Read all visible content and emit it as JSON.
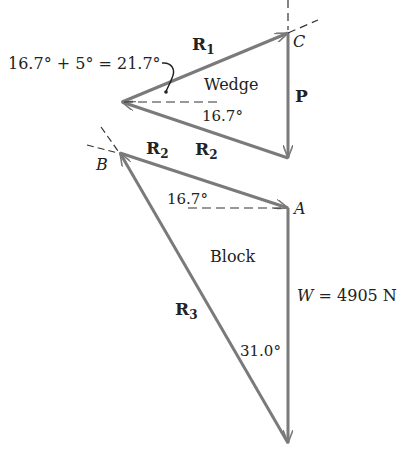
{
  "colors": {
    "vector": "#7a7a7a",
    "text": "#222222",
    "dash": "#333333"
  },
  "wedge": {
    "label": "Wedge",
    "angle_bottom": "16.7°",
    "angle_annotation": "16.7° + 5° = 21.7°",
    "forces": {
      "R1": "R",
      "R1_sub": "1",
      "P": "P",
      "R2": "R",
      "R2_sub": "2"
    },
    "point_C": "C"
  },
  "block": {
    "label": "Block",
    "angle_top": "16.7°",
    "angle_bottom": "31.0°",
    "forces": {
      "R2": "R",
      "R2_sub": "2",
      "R3": "R",
      "R3_sub": "3"
    },
    "weight_var": "W",
    "weight_eq": " = 4905 N",
    "point_A": "A",
    "point_B": "B"
  }
}
